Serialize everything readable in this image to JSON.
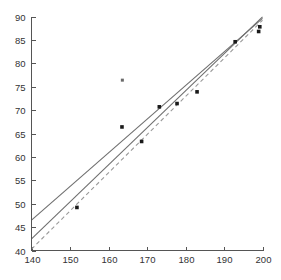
{
  "chart_data": {
    "type": "scatter",
    "title": "",
    "subtitle": "",
    "xlabel": "",
    "ylabel": "",
    "xlim": [
      140,
      200
    ],
    "ylim": [
      40,
      90
    ],
    "xticks": [
      140,
      150,
      160,
      170,
      180,
      190,
      200
    ],
    "yticks": [
      40,
      45,
      50,
      55,
      60,
      65,
      70,
      75,
      80,
      85,
      90
    ],
    "xtick_labels": [
      "140",
      "150",
      "160",
      "170",
      "180",
      "190",
      "200"
    ],
    "ytick_labels": [
      "40",
      "45",
      "50",
      "55",
      "60",
      "65",
      "70",
      "75",
      "80",
      "85",
      "90"
    ],
    "grid": false,
    "legend": null,
    "legend_position": "none",
    "series": [
      {
        "name": "observations",
        "type": "scatter",
        "marker": "filled-square",
        "color": "#1a1a1a",
        "points": [
          {
            "x": 151.8,
            "y": 49.2
          },
          {
            "x": 163.5,
            "y": 66.4
          },
          {
            "x": 168.6,
            "y": 63.3
          },
          {
            "x": 173.2,
            "y": 70.7
          },
          {
            "x": 177.8,
            "y": 71.4
          },
          {
            "x": 183.0,
            "y": 73.9
          },
          {
            "x": 192.9,
            "y": 84.6
          },
          {
            "x": 199.0,
            "y": 86.8
          },
          {
            "x": 199.3,
            "y": 87.8
          }
        ]
      },
      {
        "name": "outlier",
        "type": "scatter",
        "marker": "open-square",
        "color": "#6a6a6a",
        "points": [
          {
            "x": 163.6,
            "y": 76.4
          }
        ]
      },
      {
        "name": "upper-fit",
        "type": "line",
        "style": "solid",
        "color": "#6f6f6f",
        "endpoints": [
          {
            "x": 140,
            "y": 46.5
          },
          {
            "x": 200,
            "y": 89.6
          }
        ]
      },
      {
        "name": "lower-fit",
        "type": "line",
        "style": "solid",
        "color": "#6f6f6f",
        "endpoints": [
          {
            "x": 140,
            "y": 42.5
          },
          {
            "x": 200,
            "y": 89.9
          }
        ]
      },
      {
        "name": "reference-line",
        "type": "line",
        "style": "dashed",
        "color": "#9a9a9a",
        "endpoints": [
          {
            "x": 140,
            "y": 40.3
          },
          {
            "x": 200,
            "y": 89.2
          }
        ]
      }
    ]
  },
  "axes": {
    "x_axis_name": "x-axis",
    "y_axis_name": "y-axis"
  }
}
